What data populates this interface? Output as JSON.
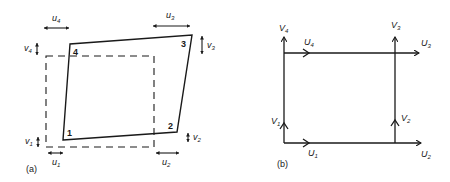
{
  "figure": {
    "panel_a": {
      "caption": "(a)",
      "node_numbers": [
        "1",
        "2",
        "3",
        "4"
      ],
      "labels": {
        "u1": {
          "base": "u",
          "sub": "1"
        },
        "u2": {
          "base": "u",
          "sub": "2"
        },
        "u3": {
          "base": "u",
          "sub": "3"
        },
        "u4": {
          "base": "u",
          "sub": "4"
        },
        "v1": {
          "base": "v",
          "sub": "1"
        },
        "v2": {
          "base": "v",
          "sub": "2"
        },
        "v3": {
          "base": "v",
          "sub": "3"
        },
        "v4": {
          "base": "v",
          "sub": "4"
        }
      },
      "description": "Deformed quadrilateral element (solid) over original rectangle (dashed) with nodal displacement arrows"
    },
    "panel_b": {
      "caption": "(b)",
      "labels": {
        "U1": {
          "base": "U",
          "sub": "1"
        },
        "U2": {
          "base": "U",
          "sub": "2"
        },
        "U3": {
          "base": "U",
          "sub": "3"
        },
        "U4": {
          "base": "U",
          "sub": "4"
        },
        "V1": {
          "base": "V",
          "sub": "1"
        },
        "V2": {
          "base": "V",
          "sub": "2"
        },
        "V3": {
          "base": "V",
          "sub": "3"
        },
        "V4": {
          "base": "V",
          "sub": "4"
        }
      },
      "description": "Rectangular frame with directed nodal displacement vectors"
    },
    "colors": {
      "ink": "#1a1a1a",
      "background": "#ffffff"
    }
  }
}
